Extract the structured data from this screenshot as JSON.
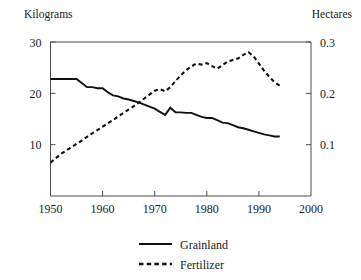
{
  "chart_data": {
    "type": "line",
    "title": "",
    "xlabel": "",
    "ylabel": "Kilograms",
    "y2label": "Hectares",
    "grid": false,
    "legend_position": "bottom-center",
    "xlim": [
      1950,
      2000
    ],
    "ylim": [
      0,
      30
    ],
    "y2lim": [
      0,
      0.3
    ],
    "xticks": [
      1950,
      1960,
      1970,
      1980,
      1990,
      2000
    ],
    "xtick_labels": [
      "1950",
      "1960",
      "1970",
      "1980",
      "1990",
      "2000"
    ],
    "yticks": [
      10,
      20,
      30
    ],
    "ytick_labels": [
      "10",
      "20",
      "30"
    ],
    "y2ticks": [
      0.1,
      0.2,
      0.3
    ],
    "y2tick_labels": [
      "0.1",
      "0.2",
      "0.3"
    ],
    "series": [
      {
        "name": "Grainland",
        "axis": "left",
        "style": "solid",
        "units": "Kilograms",
        "x": [
          1950,
          1951,
          1952,
          1953,
          1954,
          1955,
          1956,
          1957,
          1958,
          1959,
          1960,
          1961,
          1962,
          1963,
          1964,
          1965,
          1966,
          1967,
          1968,
          1969,
          1970,
          1971,
          1972,
          1973,
          1974,
          1975,
          1976,
          1977,
          1978,
          1979,
          1980,
          1981,
          1982,
          1983,
          1984,
          1985,
          1986,
          1987,
          1988,
          1989,
          1990,
          1991,
          1992,
          1993,
          1994
        ],
        "values": [
          22.8,
          22.8,
          22.8,
          22.8,
          22.8,
          22.8,
          22.0,
          21.2,
          21.2,
          21.0,
          21.0,
          20.2,
          19.6,
          19.4,
          19.0,
          18.8,
          18.5,
          18.2,
          17.8,
          17.4,
          17.0,
          16.4,
          15.8,
          17.2,
          16.3,
          16.3,
          16.2,
          16.2,
          15.8,
          15.4,
          15.2,
          15.2,
          14.8,
          14.3,
          14.2,
          13.8,
          13.4,
          13.2,
          12.9,
          12.6,
          12.3,
          12.0,
          11.8,
          11.6,
          11.6
        ]
      },
      {
        "name": "Fertilizer",
        "axis": "right",
        "style": "dashed",
        "units": "Hectares",
        "x": [
          1950,
          1952,
          1954,
          1956,
          1958,
          1960,
          1962,
          1964,
          1966,
          1968,
          1970,
          1971,
          1972,
          1973,
          1974,
          1975,
          1976,
          1977,
          1978,
          1979,
          1980,
          1981,
          1982,
          1983,
          1984,
          1985,
          1986,
          1987,
          1988,
          1989,
          1990,
          1991,
          1992,
          1993,
          1994
        ],
        "values": [
          0.065,
          0.082,
          0.095,
          0.108,
          0.122,
          0.135,
          0.148,
          0.162,
          0.175,
          0.19,
          0.205,
          0.208,
          0.204,
          0.212,
          0.224,
          0.235,
          0.245,
          0.252,
          0.258,
          0.256,
          0.259,
          0.253,
          0.248,
          0.255,
          0.262,
          0.265,
          0.268,
          0.275,
          0.28,
          0.272,
          0.258,
          0.244,
          0.232,
          0.222,
          0.215
        ]
      }
    ],
    "legend": [
      {
        "label": "Grainland",
        "style": "solid"
      },
      {
        "label": "Fertilizer",
        "style": "dashed"
      }
    ]
  },
  "labels": {
    "left_axis_title": "Kilograms",
    "right_axis_title": "Hectares"
  }
}
